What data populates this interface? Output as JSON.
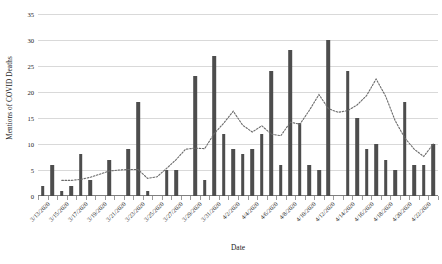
{
  "chart_data": {
    "type": "bar",
    "title": "",
    "xlabel": "Date",
    "ylabel": "Mentions of COVID Deaths",
    "ylim": [
      0,
      35
    ],
    "yticks": [
      0,
      5,
      10,
      15,
      20,
      25,
      30,
      35
    ],
    "grid": true,
    "legend": "none",
    "categories": [
      "3/13/2020",
      "3/14/2020",
      "3/15/2020",
      "3/16/2020",
      "3/17/2020",
      "3/18/2020",
      "3/19/2020",
      "3/20/2020",
      "3/21/2020",
      "3/22/2020",
      "3/23/2020",
      "3/24/2020",
      "3/25/2020",
      "3/26/2020",
      "3/27/2020",
      "3/28/2020",
      "3/29/2020",
      "3/30/2020",
      "3/31/2020",
      "4/1/2020",
      "4/2/2020",
      "4/3/2020",
      "4/4/2020",
      "4/5/2020",
      "4/6/2020",
      "4/7/2020",
      "4/8/2020",
      "4/9/2020",
      "4/10/2020",
      "4/11/2020",
      "4/12/2020",
      "4/13/2020",
      "4/14/2020",
      "4/15/2020",
      "4/16/2020",
      "4/17/2020",
      "4/18/2020",
      "4/19/2020",
      "4/20/2020",
      "4/21/2020",
      "4/22/2020",
      "4/23/2020"
    ],
    "tick_labels": [
      "3/13/2020",
      "3/15/2020",
      "3/17/2020",
      "3/19/2020",
      "3/21/2020",
      "3/23/2020",
      "3/25/2020",
      "3/27/2020",
      "3/29/2020",
      "3/31/2020",
      "4/2/2020",
      "4/4/2020",
      "4/6/2020",
      "4/8/2020",
      "4/10/2020",
      "4/12/2020",
      "4/14/2020",
      "4/16/2020",
      "4/18/2020",
      "4/20/2020",
      "4/22/2020"
    ],
    "series": [
      {
        "name": "Mentions of COVID Deaths",
        "kind": "bar",
        "color": "#4d4d4d",
        "values": [
          2,
          6,
          1,
          2,
          8,
          3,
          0,
          7,
          0,
          9,
          18,
          1,
          0,
          5,
          5,
          0,
          23,
          3,
          27,
          12,
          9,
          8,
          9,
          12,
          24,
          6,
          28,
          14,
          6,
          5,
          30,
          0,
          24,
          15,
          9,
          10,
          7,
          5,
          18,
          6,
          6,
          10
        ]
      },
      {
        "name": "Trend (moving average)",
        "kind": "line",
        "style": "dotted",
        "color": "#6b6b6b",
        "values": [
          null,
          null,
          3,
          3,
          3.2,
          3.6,
          4.2,
          4.8,
          5,
          5.1,
          5.1,
          3.4,
          3.7,
          5.3,
          7,
          9,
          9.2,
          9.1,
          12,
          14,
          16.3,
          13.6,
          12.3,
          13.5,
          11.9,
          11.6,
          14.2,
          13.8,
          16.5,
          19.5,
          16.8,
          16.1,
          16.4,
          17.5,
          19.3,
          22.5,
          19.2,
          14.5,
          11.2,
          9,
          7.6,
          10
        ]
      }
    ]
  },
  "axis": {
    "y_title": "Mentions of COVID Deaths",
    "x_title": "Date"
  }
}
